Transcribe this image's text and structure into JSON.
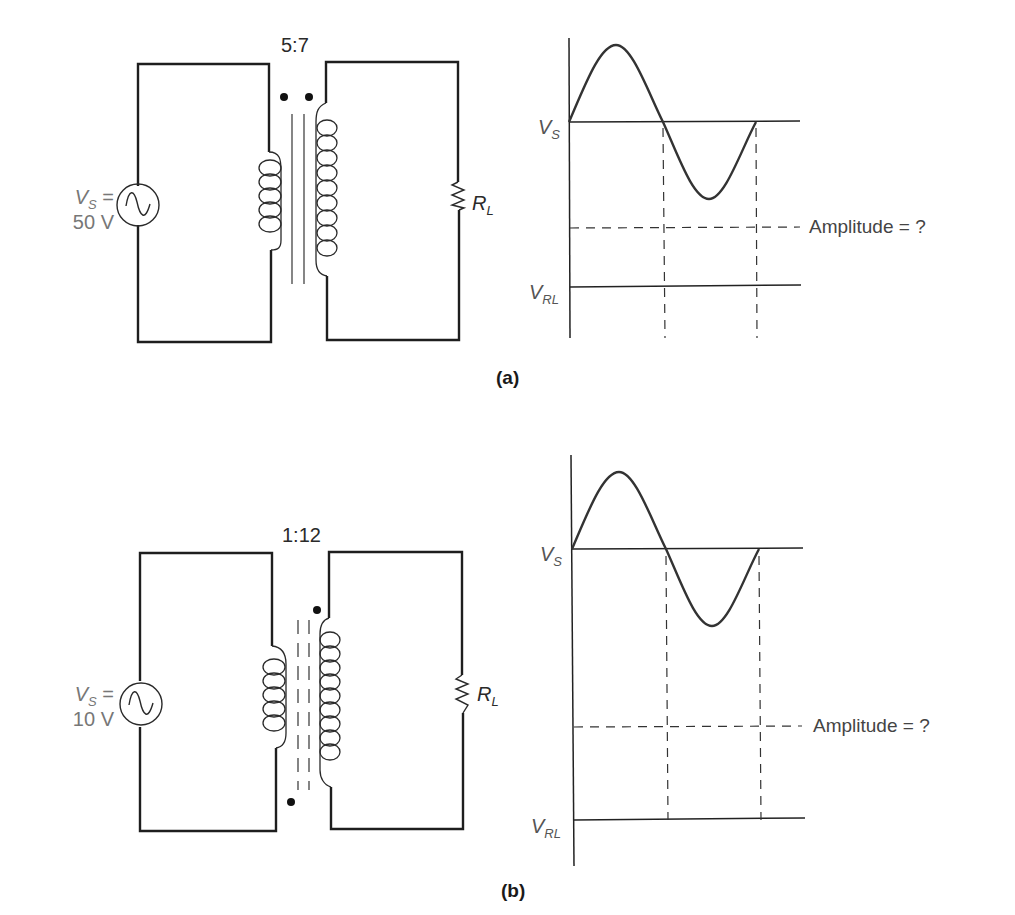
{
  "figure": {
    "panels": [
      {
        "id": "a",
        "caption": "(a)",
        "turns_ratio": "5:7",
        "source": {
          "symbol": "V",
          "subscript": "S",
          "equals": " =",
          "value": "50 V"
        },
        "load": {
          "symbol": "R",
          "subscript": "L"
        },
        "core_type": "solid iron core",
        "dot_convention": "both dots at top",
        "waveform": {
          "input_label": {
            "symbol": "V",
            "subscript": "S"
          },
          "output_label": {
            "symbol": "V",
            "subscript": "RL"
          },
          "annotation": "Amplitude = ?"
        }
      },
      {
        "id": "b",
        "caption": "(b)",
        "turns_ratio": "1:12",
        "source": {
          "symbol": "V",
          "subscript": "S",
          "equals": " =",
          "value": "10 V"
        },
        "load": {
          "symbol": "R",
          "subscript": "L"
        },
        "core_type": "dashed ferrite core",
        "dot_convention": "primary dot at bottom, secondary dot at top",
        "waveform": {
          "input_label": {
            "symbol": "V",
            "subscript": "S"
          },
          "output_label": {
            "symbol": "V",
            "subscript": "RL"
          },
          "annotation": "Amplitude = ?"
        }
      }
    ]
  }
}
